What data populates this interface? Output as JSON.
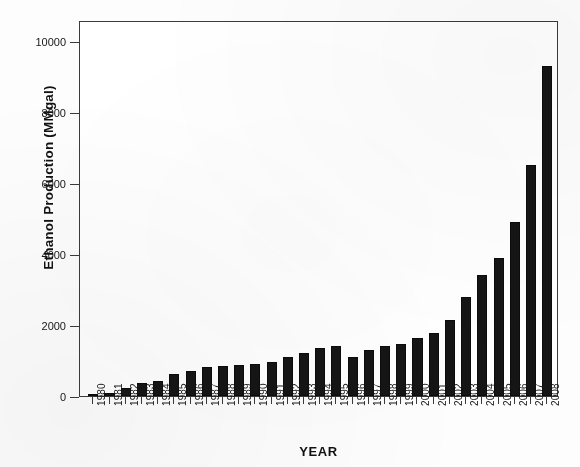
{
  "chart_data": {
    "type": "bar",
    "title": "",
    "xlabel": "YEAR",
    "ylabel": "Ethanol Production (MMgal)",
    "ylim": [
      0,
      10600
    ],
    "yticks": [
      0,
      2000,
      4000,
      6000,
      8000,
      10000
    ],
    "ytick_labels": [
      "0",
      "2000",
      "4000",
      "6000",
      "8000",
      "10000"
    ],
    "grid": false,
    "legend": "none",
    "bar_color": "#151515",
    "categories": [
      "1980",
      "1981",
      "1982",
      "1983",
      "1984",
      "1985",
      "1986",
      "1987",
      "1988",
      "1989",
      "1990",
      "1991",
      "1992",
      "1993",
      "1994",
      "1995",
      "1996",
      "1997",
      "1998",
      "1999",
      "2000",
      "2001",
      "2002",
      "2003",
      "2004",
      "2005",
      "2006",
      "2007",
      "2008"
    ],
    "values": [
      20,
      80,
      220,
      375,
      430,
      610,
      710,
      830,
      845,
      870,
      900,
      950,
      1100,
      1200,
      1350,
      1400,
      1100,
      1300,
      1400,
      1470,
      1630,
      1770,
      2130,
      2800,
      3400,
      3900,
      4900,
      6500,
      9300
    ],
    "units": "MMgal",
    "series": [
      {
        "name": "Ethanol Production",
        "values": [
          20,
          80,
          220,
          375,
          430,
          610,
          710,
          830,
          845,
          870,
          900,
          950,
          1100,
          1200,
          1350,
          1400,
          1100,
          1300,
          1400,
          1470,
          1630,
          1770,
          2130,
          2800,
          3400,
          3900,
          4900,
          6500,
          9300
        ]
      }
    ]
  },
  "figure": {
    "x_axis_title": "YEAR",
    "y_axis_title": "Ethanol Production (MMgal)"
  }
}
